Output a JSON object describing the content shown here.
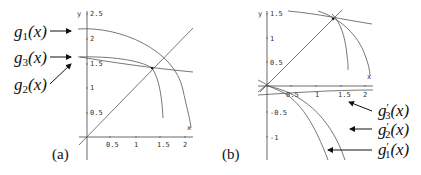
{
  "panels": [
    {
      "id": "a",
      "label": "(a)",
      "axis_labels": {
        "x": "x",
        "y": "y"
      },
      "x_ticks": [
        "0.5",
        "1",
        "1.5",
        "2"
      ],
      "y_ticks": [
        "2.5",
        "2",
        "1.5",
        "1",
        "0.5"
      ],
      "annotations": [
        {
          "base": "g",
          "sub": "1",
          "arg": "(x)"
        },
        {
          "base": "g",
          "sub": "3",
          "arg": "(x)"
        },
        {
          "base": "g",
          "sub": "2",
          "arg": "(x)"
        }
      ]
    },
    {
      "id": "b",
      "label": "(b)",
      "axis_labels": {
        "x": "x",
        "y": "y"
      },
      "x_ticks": [
        "0.5",
        "1",
        "1.5",
        "2"
      ],
      "y_ticks": [
        "1.5",
        "1",
        "0.5",
        "-0.5",
        "-1"
      ],
      "annotations": [
        {
          "base": "g",
          "prime": "′",
          "sub": "3",
          "arg": "(x)"
        },
        {
          "base": "g",
          "prime": "′",
          "sub": "2",
          "arg": "(x)"
        },
        {
          "base": "g",
          "prime": "′",
          "sub": "1",
          "arg": "(x)"
        }
      ]
    }
  ]
}
